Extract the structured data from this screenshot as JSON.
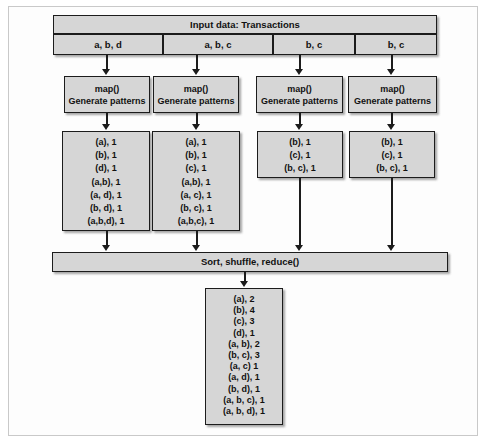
{
  "figure": {
    "colors": {
      "box_fill": "#d6d6d6",
      "box_border": "#1c1c1c",
      "frame": "#c9c9c9",
      "page_background": "#ffffff"
    }
  },
  "header": {
    "title": "Input data: Transactions",
    "splits": [
      {
        "label": "a, b, d"
      },
      {
        "label": "a, b, c"
      },
      {
        "label": "b, c"
      },
      {
        "label": "b, c"
      }
    ]
  },
  "mappers": [
    {
      "line1": "map()",
      "line2": "Generate patterns"
    },
    {
      "line1": "map()",
      "line2": "Generate patterns"
    },
    {
      "line1": "map()",
      "line2": "Generate patterns"
    },
    {
      "line1": "map()",
      "line2": "Generate patterns"
    }
  ],
  "map_outputs": [
    {
      "rows": [
        "(a), 1",
        "(b), 1",
        "(d), 1",
        "(a,b), 1",
        "(a, d), 1",
        "(b, d), 1",
        "(a,b,d), 1"
      ]
    },
    {
      "rows": [
        "(a), 1",
        "(b), 1",
        "(c), 1",
        "(a,b), 1",
        "(a, c), 1",
        "(b, c), 1",
        "(a,b,c), 1"
      ]
    },
    {
      "rows": [
        "(b), 1",
        "(c), 1",
        "(b, c), 1"
      ]
    },
    {
      "rows": [
        "(b), 1",
        "(c), 1",
        "(b, c), 1"
      ]
    }
  ],
  "reducer": {
    "label": "Sort, shuffle, reduce()"
  },
  "final_output": {
    "rows": [
      "(a), 2",
      "(b), 4",
      "(c), 3",
      "(d), 1",
      "(a, b), 2",
      "(b, c), 3",
      "(a, c) 1",
      "(a, d), 1",
      "(b, d), 1",
      "(a, b, c), 1",
      "(a, b, d), 1"
    ]
  }
}
